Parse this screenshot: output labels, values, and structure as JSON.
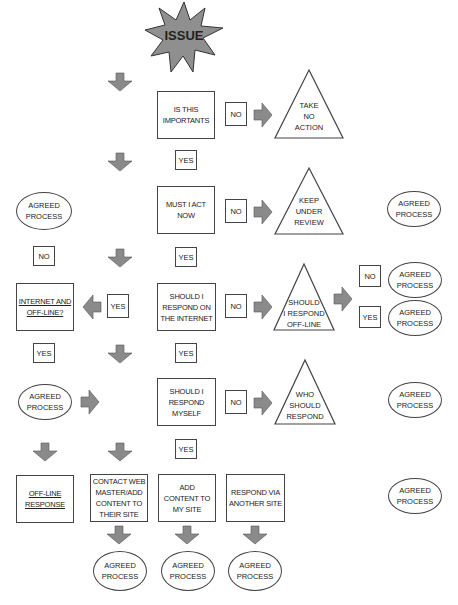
{
  "start": {
    "label": "ISSUE"
  },
  "decisions": [
    {
      "label": "IS THIS\nIMPORTANTS"
    },
    {
      "label": "MUST I ACT\nNOW"
    },
    {
      "label": "SHOULD I\nRESPOND ON\nTHE INTERNET"
    },
    {
      "label": "SHOULD I\nRESPOND\nMYSELF"
    }
  ],
  "outcomes": [
    {
      "label": "TAKE\nNO\nACTION"
    },
    {
      "label": "KEEP\nUNDER\nREVIEW"
    },
    {
      "label": "SHOULD\nI RESPOND\nOFF-LINE"
    },
    {
      "label": "WHO\nSHOULD\nRESPOND"
    }
  ],
  "left_branch": {
    "question": "INTERNET AND\nOFF-LINE?",
    "offline_response": "OFF-LINE\nRESPONSE"
  },
  "actions": [
    {
      "label": "CONTACT WEB\nMASTER/ADD\nCONTENT TO\nTHEIR SITE"
    },
    {
      "label": "ADD\nCONTENT TO\nMY SITE"
    },
    {
      "label": "RESPOND VIA\nANOTHER SITE"
    }
  ],
  "labels": {
    "yes": "YES",
    "no": "NO"
  },
  "agreed_process": "AGREED\nPROCESS",
  "colors": {
    "arrow": "#8a8a8a",
    "star": "#8f8f8f",
    "border": "#444444"
  }
}
